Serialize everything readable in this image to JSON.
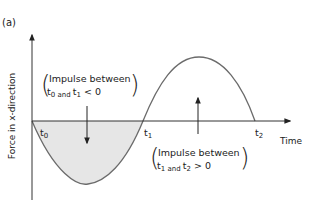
{
  "panel_label": "(a)",
  "axes": {
    "y_label": "Force in x-direction",
    "x_label": "Time"
  },
  "ticks": [
    {
      "base": "t",
      "sub": "0"
    },
    {
      "base": "t",
      "sub": "1"
    },
    {
      "base": "t",
      "sub": "2"
    }
  ],
  "annotations": [
    {
      "line1": "Impulse between",
      "line2_t_a": "t",
      "line2_sub_a": "0",
      "line2_and": " and ",
      "line2_t_b": "t",
      "line2_sub_b": "1",
      "line2_rel": " < 0",
      "direction": "down"
    },
    {
      "line1": "Impulse between",
      "line2_t_a": "t",
      "line2_sub_a": "1",
      "line2_and": " and ",
      "line2_t_b": "t",
      "line2_sub_b": "2",
      "line2_rel": " > 0",
      "direction": "up"
    }
  ],
  "colors": {
    "curve": "#6b6b6b",
    "axis": "#333333",
    "shade": "#e6e6e6",
    "arrow": "#222222"
  }
}
